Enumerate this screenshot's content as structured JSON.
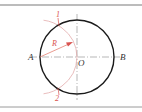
{
  "diagram": {
    "type": "geometric-construction",
    "labels": {
      "point_a": "A",
      "point_b": "B",
      "center": "O",
      "radius": "R",
      "intersection_1": "1",
      "intersection_2": "2"
    },
    "colors": {
      "circle": "#1a1a1a",
      "construction": "#d9534f",
      "centerline": "#888888",
      "border": "#7a7a7a",
      "label": "#333333"
    },
    "geometry": {
      "circle_center": [
        77,
        57
      ],
      "circle_radius": 37,
      "arc_center": [
        40,
        57
      ],
      "arc_radius": 37
    }
  }
}
